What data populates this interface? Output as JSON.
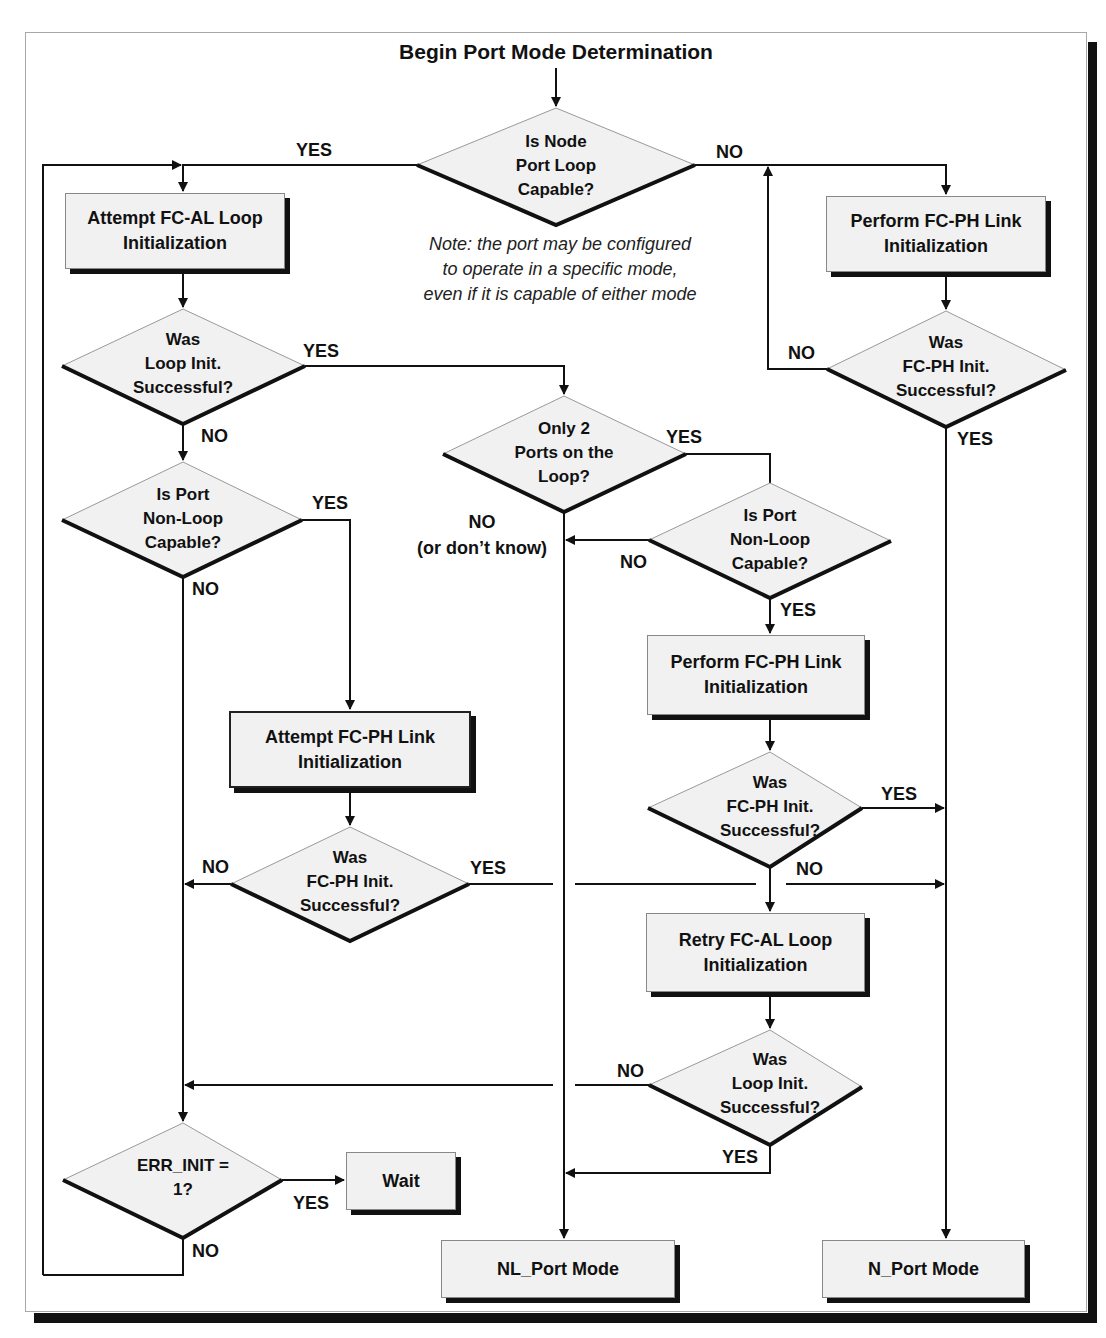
{
  "diagram": {
    "title": "Begin Port Mode Determination",
    "note": [
      "Note: the port may be configured",
      "to operate in a specific mode,",
      "even if it is capable of either mode"
    ],
    "boxes": {
      "attempt_fcal": [
        "Attempt FC-AL Loop",
        "Initialization"
      ],
      "perform_fcph_top": [
        "Perform FC-PH Link",
        "Initialization"
      ],
      "perform_fcph_mid": [
        "Perform FC-PH Link",
        "Initialization"
      ],
      "attempt_fcph": [
        "Attempt FC-PH Link",
        "Initialization"
      ],
      "retry_fcal": [
        "Retry FC-AL Loop",
        "Initialization"
      ],
      "wait": [
        "Wait"
      ],
      "nl_port_mode": [
        "NL_Port Mode"
      ],
      "n_port_mode": [
        "N_Port Mode"
      ]
    },
    "decisions": {
      "node_loop_capable": [
        "Is Node",
        "Port Loop",
        "Capable?"
      ],
      "loop_init_ok_1": [
        "Was",
        "Loop Init.",
        "Successful?"
      ],
      "fcph_init_ok_top": [
        "Was",
        "FC-PH Init.",
        "Successful?"
      ],
      "only_two_ports": [
        "Only 2",
        "Ports on the",
        "Loop?"
      ],
      "non_loop_capable_left": [
        "Is Port",
        "Non-Loop",
        "Capable?"
      ],
      "non_loop_capable_right": [
        "Is Port",
        "Non-Loop",
        "Capable?"
      ],
      "fcph_init_ok_mid": [
        "Was",
        "FC-PH Init.",
        "Successful?"
      ],
      "fcph_init_ok_left": [
        "Was",
        "FC-PH Init.",
        "Successful?"
      ],
      "loop_init_ok_2": [
        "Was",
        "Loop Init.",
        "Successful?"
      ],
      "err_init": [
        "ERR_INIT =",
        "1?"
      ]
    },
    "edge_labels": {
      "d1_yes": "YES",
      "d1_no": "NO",
      "d2_yes": "YES",
      "d2_no": "NO",
      "d3_no": "NO",
      "d3_yes": "YES",
      "d4_yes": "YES",
      "d4_no": "NO",
      "d4_no_sub": "(or don’t know)",
      "d5_yes": "YES",
      "d5_no": "NO",
      "d6_no": "NO",
      "d6_yes": "YES",
      "d7_yes": "YES",
      "d7_no": "NO",
      "d8_no": "NO",
      "d8_yes": "YES",
      "d9_no": "NO",
      "d9_yes": "YES",
      "d10_yes": "YES",
      "d10_no": "NO"
    },
    "colors": {
      "shape_fill": "#f1f1f1",
      "line": "#111111",
      "shadow": "#111111",
      "frame_border": "#a8a8a8"
    }
  }
}
